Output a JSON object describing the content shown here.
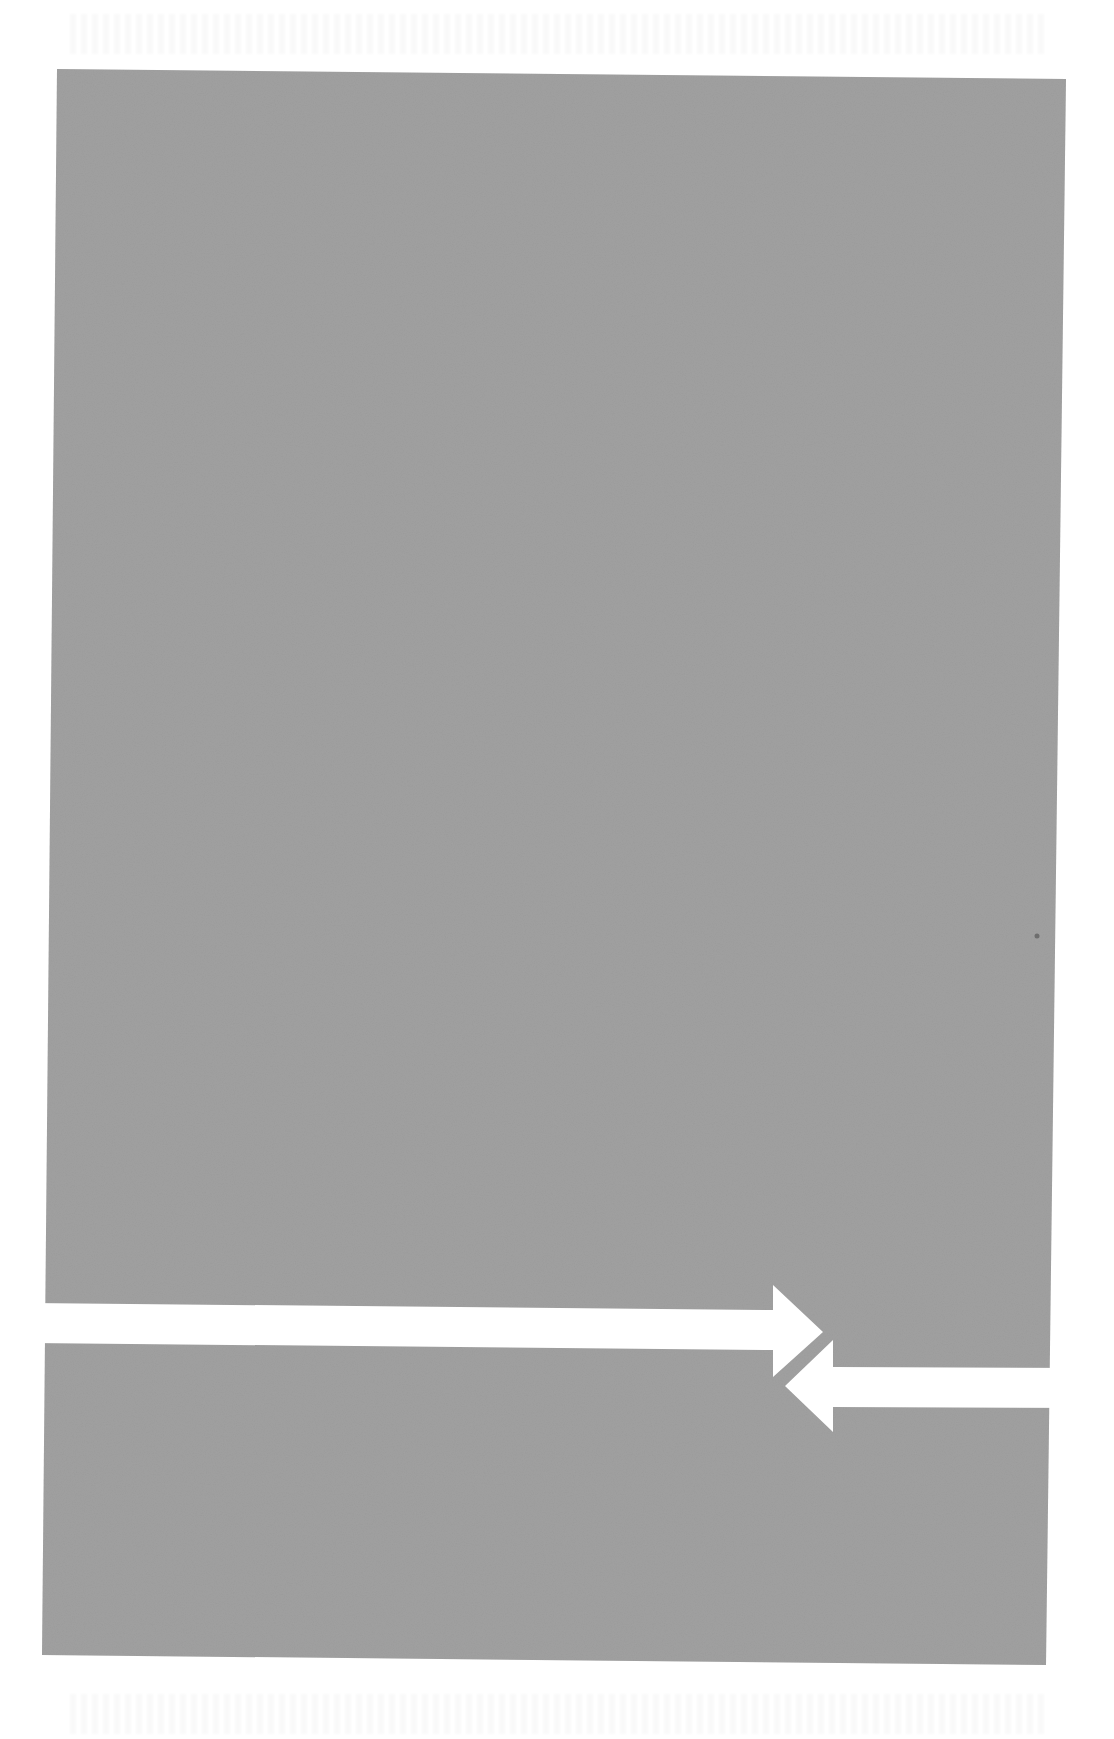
{
  "page": {
    "width": 1114,
    "height": 1739,
    "background": "#ffffff"
  },
  "diagram": {
    "field": {
      "color": "#9b9b9b",
      "points": "57,69 1066,79 1046,1665 42,1655"
    },
    "arrows": [
      {
        "name": "right-arrow",
        "direction": "right",
        "color": "#ffffff",
        "points": "30,1303 773,1310 773,1285 823,1332 773,1377 773,1350 30,1343"
      },
      {
        "name": "left-arrow",
        "direction": "left",
        "color": "#ffffff",
        "points": "1090,1368 833,1367 833,1340 785,1386 833,1432 833,1407 1090,1408"
      }
    ],
    "artifacts": [
      {
        "type": "speck",
        "x": 1037,
        "y": 936,
        "r": 2.5,
        "color": "#6e6e6e"
      }
    ]
  }
}
